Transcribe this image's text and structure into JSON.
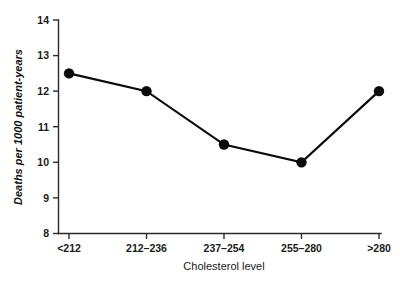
{
  "chart_data": {
    "type": "line",
    "title": "",
    "xlabel": "Cholesterol level",
    "ylabel": "Deaths per 1000 patient-years",
    "categories": [
      "<212",
      "212–236",
      "237–254",
      "255–280",
      ">280"
    ],
    "values": [
      12.5,
      12.0,
      10.5,
      10.0,
      12.0
    ],
    "ylim": [
      8,
      14
    ],
    "yticks": [
      8,
      9,
      10,
      11,
      12,
      13,
      14
    ],
    "ytick_labels": [
      "8",
      "9",
      "10",
      "11",
      "12",
      "13",
      "14"
    ],
    "grid": false,
    "legend": null,
    "series": [
      {
        "name": "Deaths per 1000 patient-years",
        "values": [
          12.5,
          12.0,
          10.5,
          10.0,
          12.0
        ],
        "color": "#0b0b0b",
        "marker": "filled-circle"
      }
    ],
    "axis_style": {
      "spines": [
        "left",
        "bottom"
      ],
      "tick_direction": "out",
      "axis_color": "#2b2b2b",
      "background": "#ffffff"
    }
  }
}
